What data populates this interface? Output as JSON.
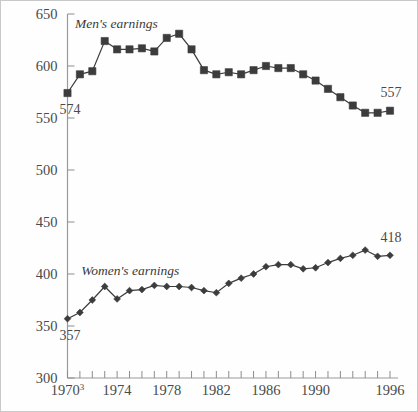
{
  "chart_data": {
    "type": "line",
    "title": "",
    "xlabel": "",
    "ylabel": "",
    "xlim": [
      1970,
      1996
    ],
    "ylim": [
      300,
      650
    ],
    "grid": false,
    "legend_position": "inline-annotation",
    "y_ticks": [
      300,
      350,
      400,
      450,
      500,
      550,
      600,
      650
    ],
    "y_tick_labels": [
      "300",
      "350",
      "400",
      "450",
      "500",
      "550",
      "600",
      "650"
    ],
    "x_ticks": [
      1970,
      1971,
      1972,
      1973,
      1974,
      1975,
      1976,
      1977,
      1978,
      1979,
      1980,
      1981,
      1982,
      1983,
      1984,
      1985,
      1986,
      1987,
      1988,
      1989,
      1990,
      1991,
      1992,
      1993,
      1994,
      1995,
      1996
    ],
    "x_tick_labels": [
      {
        "value": 1970,
        "label": "1970",
        "superscript": "3"
      },
      {
        "value": 1974,
        "label": "1974",
        "superscript": ""
      },
      {
        "value": 1978,
        "label": "1978",
        "superscript": ""
      },
      {
        "value": 1982,
        "label": "1982",
        "superscript": ""
      },
      {
        "value": 1986,
        "label": "1986",
        "superscript": ""
      },
      {
        "value": 1990,
        "label": "1990",
        "superscript": ""
      },
      {
        "value": 1996,
        "label": "1996",
        "superscript": ""
      }
    ],
    "x": [
      1970,
      1971,
      1972,
      1973,
      1974,
      1975,
      1976,
      1977,
      1978,
      1979,
      1980,
      1981,
      1982,
      1983,
      1984,
      1985,
      1986,
      1987,
      1988,
      1989,
      1990,
      1991,
      1992,
      1993,
      1994,
      1995,
      1996
    ],
    "series": [
      {
        "name": "Men's earnings",
        "label": "Men's earnings",
        "marker": "square",
        "color": "#3c3c3c",
        "start_value": 574,
        "end_value": 557,
        "start_label": "574",
        "end_label": "557",
        "values": [
          574,
          592,
          595,
          624,
          616,
          616,
          617,
          614,
          627,
          631,
          616,
          596,
          592,
          594,
          592,
          596,
          600,
          598,
          598,
          592,
          586,
          578,
          570,
          562,
          555,
          555,
          557
        ]
      },
      {
        "name": "Women's earnings",
        "label": "Women's earnings",
        "marker": "diamond",
        "color": "#3c3c3c",
        "start_value": 357,
        "end_value": 418,
        "start_label": "357",
        "end_label": "418",
        "values": [
          357,
          363,
          375,
          388,
          376,
          384,
          385,
          389,
          388,
          388,
          387,
          384,
          382,
          391,
          396,
          400,
          407,
          409,
          409,
          405,
          406,
          411,
          415,
          418,
          423,
          417,
          418
        ]
      }
    ],
    "annotations": [
      {
        "text": "574",
        "series": "Men's earnings",
        "position": "below-first-point"
      },
      {
        "text": "557",
        "series": "Men's earnings",
        "position": "above-last-point"
      },
      {
        "text": "357",
        "series": "Women's earnings",
        "position": "below-first-point"
      },
      {
        "text": "418",
        "series": "Women's earnings",
        "position": "above-last-point"
      },
      {
        "text": "Men's earnings",
        "series": "Men's earnings",
        "position": "inline-left"
      },
      {
        "text": "Women's earnings",
        "series": "Women's earnings",
        "position": "inline-left"
      }
    ],
    "colors": {
      "marker": "#3c3c3c",
      "line": "#3c3c3c",
      "axis": "#9a9a9a",
      "text": "#4a4a4a",
      "background": "#fefefe",
      "border": "#c9c9c9"
    }
  }
}
